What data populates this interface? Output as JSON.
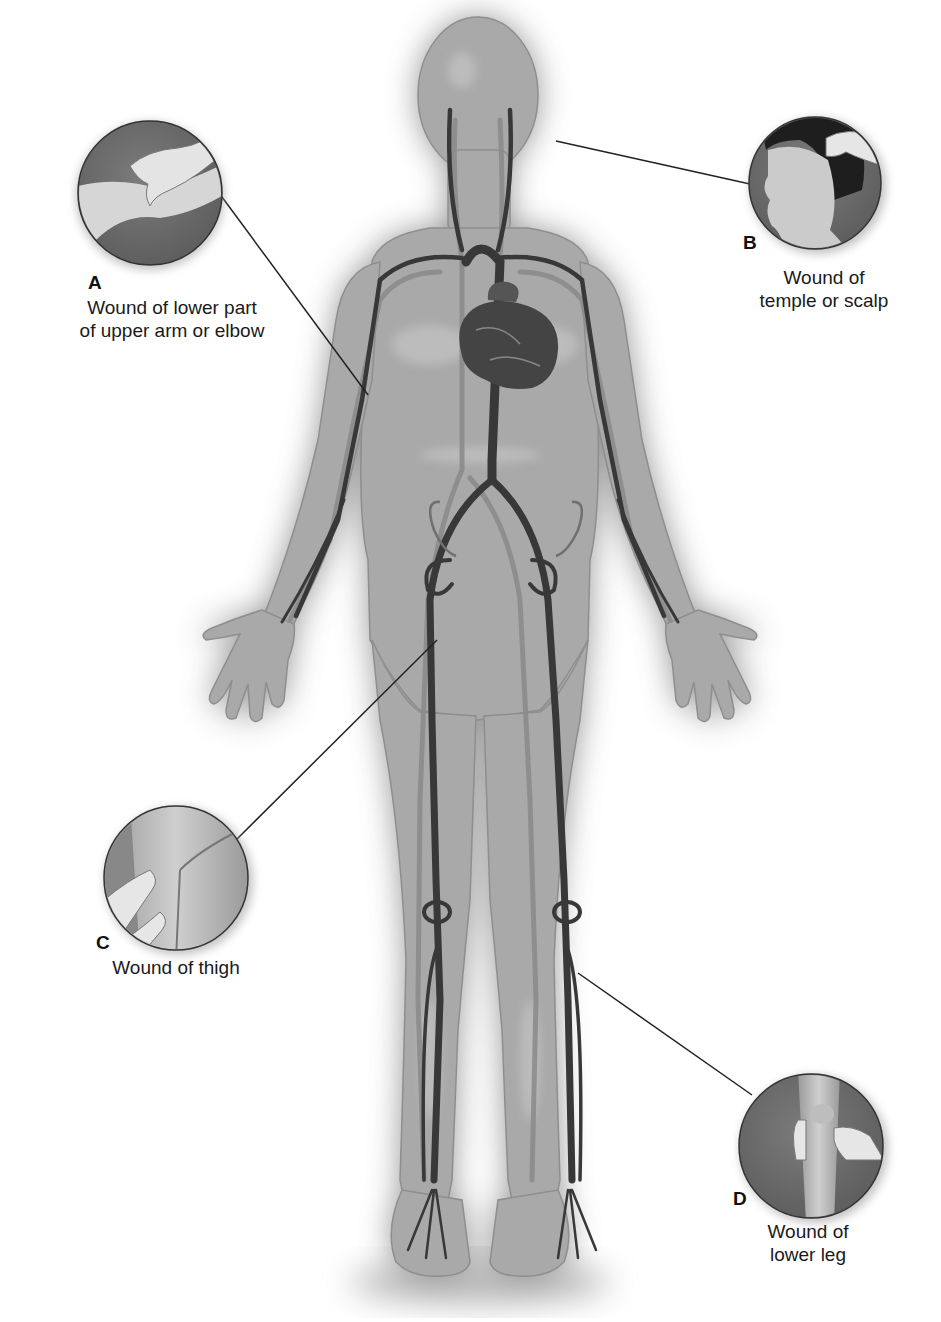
{
  "diagram": {
    "colors": {
      "background": "#ffffff",
      "body_fill": "#a8a8a8",
      "body_glow": "#7a7a7a",
      "artery": "#3a3a3a",
      "vein": "#8c8c8c",
      "callout_bg": "#6e6e6e",
      "skin": "#d8d8d8",
      "leader_line": "#222222",
      "text": "#1a1a1a"
    },
    "callouts": [
      {
        "letter": "A",
        "caption_lines": [
          "Wound of lower part",
          "of upper arm or elbow"
        ],
        "pressure_point": "brachial artery (inner upper arm)",
        "circle": {
          "cx": 150,
          "cy": 193,
          "r": 72
        },
        "leader": {
          "x1": 222,
          "y1": 197,
          "x2": 368,
          "y2": 395
        }
      },
      {
        "letter": "B",
        "caption_lines": [
          "Wound of",
          "temple or scalp"
        ],
        "pressure_point": "temporal artery (in front of ear)",
        "circle": {
          "cx": 815,
          "cy": 183,
          "r": 66
        },
        "leader": {
          "x1": 556,
          "y1": 141,
          "x2": 750,
          "y2": 184
        }
      },
      {
        "letter": "C",
        "caption_lines": [
          "Wound of thigh"
        ],
        "pressure_point": "femoral artery (groin)",
        "circle": {
          "cx": 176,
          "cy": 878,
          "r": 72
        },
        "leader": {
          "x1": 236,
          "y1": 840,
          "x2": 437,
          "y2": 640
        }
      },
      {
        "letter": "D",
        "caption_lines": [
          "Wound of",
          "lower leg"
        ],
        "pressure_point": "popliteal artery (behind knee)",
        "circle": {
          "cx": 811,
          "cy": 1146,
          "r": 72
        },
        "leader": {
          "x1": 752,
          "y1": 1095,
          "x2": 578,
          "y2": 973
        }
      }
    ]
  }
}
